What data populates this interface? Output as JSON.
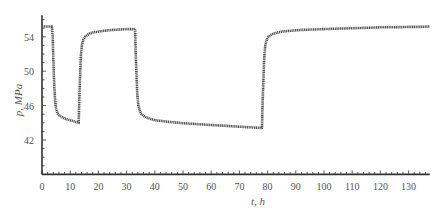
{
  "chart_data": {
    "type": "line",
    "title": "",
    "xlabel": "t, h",
    "ylabel": "p, MPa",
    "xlim": [
      0,
      137.5
    ],
    "ylim": [
      38,
      56.5
    ],
    "xticks": [
      0,
      10,
      20,
      30,
      40,
      50,
      60,
      70,
      80,
      90,
      100,
      110,
      120,
      130
    ],
    "xtick_labels": [
      "0",
      "10",
      "20",
      "30",
      "40",
      "50",
      "60",
      "70",
      "80",
      "90",
      "100",
      "110",
      "120",
      "130"
    ],
    "yticks": [
      42,
      46,
      50,
      54
    ],
    "ytick_labels": [
      "42",
      "46",
      "50",
      "54"
    ],
    "grid": false,
    "legend": null,
    "series": [
      {
        "name": "pressure",
        "color": "#555555",
        "x": [
          0,
          3.5,
          3.8,
          4.0,
          4.3,
          4.6,
          5.0,
          5.5,
          6,
          7,
          8,
          9,
          10,
          11,
          12,
          13.0,
          13.2,
          13.5,
          13.8,
          14.2,
          14.7,
          15.3,
          16,
          17,
          18,
          20,
          22,
          25,
          28,
          30,
          33.0,
          33.2,
          33.5,
          33.8,
          34.2,
          34.7,
          35.3,
          36,
          37,
          38,
          40,
          45,
          50,
          55,
          60,
          65,
          70,
          75,
          78.0,
          78.2,
          78.5,
          78.8,
          79.2,
          79.7,
          80.3,
          81,
          82,
          83,
          85,
          88,
          92,
          96,
          100,
          105,
          110,
          115,
          120,
          125,
          130,
          134,
          137.5
        ],
        "values": [
          55.2,
          55.2,
          54.0,
          51.5,
          48.8,
          46.8,
          45.6,
          45.1,
          44.9,
          44.7,
          44.5,
          44.4,
          44.3,
          44.2,
          44.1,
          44.0,
          46.5,
          49.5,
          51.8,
          53.1,
          53.7,
          54.0,
          54.2,
          54.4,
          54.5,
          54.6,
          54.7,
          54.8,
          54.85,
          54.9,
          54.9,
          52.5,
          49.5,
          47.3,
          46.0,
          45.4,
          45.0,
          44.8,
          44.6,
          44.5,
          44.3,
          44.1,
          43.95,
          43.85,
          43.75,
          43.65,
          43.55,
          43.45,
          43.4,
          46.0,
          49.0,
          51.5,
          53.0,
          53.7,
          54.0,
          54.2,
          54.35,
          54.45,
          54.6,
          54.7,
          54.8,
          54.85,
          54.9,
          54.95,
          55.0,
          55.05,
          55.1,
          55.1,
          55.15,
          55.15,
          55.2
        ]
      }
    ]
  }
}
